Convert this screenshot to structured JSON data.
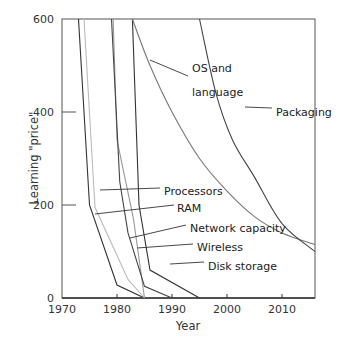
{
  "chart_data": {
    "type": "line",
    "title": "",
    "xlabel": "Year",
    "ylabel": "Learning \"price\"",
    "xlim": [
      1970,
      2016
    ],
    "ylim": [
      0,
      600
    ],
    "xticks": [
      1970,
      1980,
      1990,
      2000,
      2010
    ],
    "yticks": [
      0,
      200,
      400,
      600
    ],
    "grid": false,
    "legend": "none (inline annotations)",
    "series": [
      {
        "name": "Processors",
        "color": "#333333",
        "points": [
          [
            1973,
            600
          ],
          [
            1975,
            200
          ],
          [
            1980,
            28
          ],
          [
            1985,
            0
          ]
        ]
      },
      {
        "name": "RAM",
        "color": "#bbbbbb",
        "points": [
          [
            1974,
            600
          ],
          [
            1976,
            195
          ],
          [
            1982,
            40
          ],
          [
            1985,
            0
          ]
        ]
      },
      {
        "name": "Network capacity",
        "color": "#999999",
        "points": [
          [
            1979.3,
            600
          ],
          [
            1980,
            340
          ],
          [
            1983,
            170
          ],
          [
            1985,
            0
          ]
        ]
      },
      {
        "name": "Wireless",
        "color": "#444444",
        "points": [
          [
            1979,
            600
          ],
          [
            1980.5,
            250
          ],
          [
            1982,
            140
          ],
          [
            1985,
            25
          ],
          [
            1990,
            0
          ]
        ]
      },
      {
        "name": "Disk storage",
        "color": "#333333",
        "points": [
          [
            1982.8,
            600
          ],
          [
            1984,
            200
          ],
          [
            1986,
            60
          ],
          [
            1995,
            0
          ]
        ]
      },
      {
        "name": "OS and language",
        "color": "#777777",
        "points": [
          [
            1982.8,
            600
          ],
          [
            1986,
            500
          ],
          [
            1990,
            400
          ],
          [
            1995,
            300
          ],
          [
            2000,
            230
          ],
          [
            2005,
            175
          ],
          [
            2010,
            140
          ],
          [
            2016,
            115
          ]
        ]
      },
      {
        "name": "Packaging",
        "color": "#444444",
        "points": [
          [
            1995,
            600
          ],
          [
            1998,
            440
          ],
          [
            2001,
            340
          ],
          [
            2005,
            260
          ],
          [
            2010,
            160
          ],
          [
            2016,
            100
          ]
        ]
      }
    ],
    "annotations": [
      {
        "text": "OS and",
        "text2": "language",
        "series": "OS and language"
      },
      {
        "text": "Packaging",
        "series": "Packaging"
      },
      {
        "text": "Processors",
        "series": "Processors"
      },
      {
        "text": "RAM",
        "series": "RAM"
      },
      {
        "text": "Network capacity",
        "series": "Network capacity"
      },
      {
        "text": "Wireless",
        "series": "Wireless"
      },
      {
        "text": "Disk storage",
        "series": "Disk storage"
      }
    ]
  }
}
